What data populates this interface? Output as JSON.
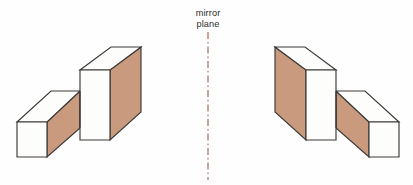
{
  "figure": {
    "background_color": "#fefefe"
  },
  "label": {
    "line1": "mirror",
    "line2": "plane",
    "full_text": "mirror plane",
    "color": "#2e2c2b",
    "x": 208,
    "line1_y": 16,
    "line2_y": 27
  },
  "mirror_plane": {
    "name": "mirror-plane",
    "orientation": "vertical",
    "x": 208,
    "y_top": 32,
    "y_bottom": 180,
    "color": "#a8675c",
    "style": "dash-dot"
  },
  "colors": {
    "edge": "#3c3a38",
    "light_face": "#fdfdfb",
    "shaded_face": "#c99a7e",
    "mirror_line": "#a8675c",
    "background": "#fefefe",
    "text": "#2e2c2b"
  },
  "shapes": [
    {
      "name": "left-block",
      "role": "original object",
      "side": "left",
      "description": "L-shaped solid: low horizontal bar on the left joined to a tall upright block on the right; shaded faces point to the right",
      "faces": {
        "bar_front": {
          "name": "bar-front-face",
          "tone": "light",
          "points": "17,122 47,122 47,157 17,157"
        },
        "bar_top": {
          "name": "bar-top-face",
          "tone": "light",
          "points": "17,122 47,122 80,91 51,91"
        },
        "bar_side": {
          "name": "bar-right-face",
          "tone": "shaded",
          "points": "47,122 80,91 80,128 47,157"
        },
        "tall_front": {
          "name": "tall-front-face",
          "tone": "light",
          "points": "80,70 110,70 110,140 80,140"
        },
        "tall_top": {
          "name": "tall-top-face",
          "tone": "light",
          "points": "80,70 110,70 141,47 111,47"
        },
        "tall_side": {
          "name": "tall-right-face",
          "tone": "shaded",
          "points": "110,70 141,47 141,112 110,140"
        }
      },
      "bar_top_back_edge": "51,91 80,91",
      "junction_edge": "80,91 80,128"
    },
    {
      "name": "right-block",
      "role": "mirror image",
      "side": "right",
      "description": "Mirror image of the left solid: tall upright block on the left joined to a low horizontal bar on the right; shaded faces point to the left",
      "faces": {
        "bar_front": {
          "name": "bar-front-face",
          "tone": "light",
          "points": "399,122 369,122 369,157 399,157"
        },
        "bar_top": {
          "name": "bar-top-face",
          "tone": "light",
          "points": "399,122 369,122 336,91 365,91"
        },
        "bar_side": {
          "name": "bar-left-face",
          "tone": "shaded",
          "points": "369,122 336,91 336,128 369,157"
        },
        "tall_front": {
          "name": "tall-front-face",
          "tone": "light",
          "points": "336,70 306,70 306,140 336,140"
        },
        "tall_top": {
          "name": "tall-top-face",
          "tone": "light",
          "points": "336,70 306,70 275,47 305,47"
        },
        "tall_side": {
          "name": "tall-left-face",
          "tone": "shaded",
          "points": "306,70 275,47 275,112 306,140"
        }
      },
      "bar_top_back_edge": "365,91 336,91",
      "junction_edge": "336,91 336,128"
    }
  ]
}
